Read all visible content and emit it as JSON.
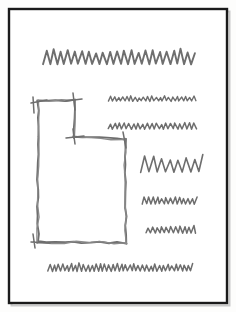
{
  "document": {
    "kind": "hand-drawn-wireframe-sketch",
    "medium": "pencil-on-paper",
    "title_alt": "Hand drawn page layout wireframe",
    "canvas": {
      "width": 236,
      "height": 312
    }
  },
  "colors": {
    "paper": "#fdfdfc",
    "page_fill": "#ffffff",
    "frame_stroke": "#1a1a1a",
    "pencil_stroke": "#6e6e6e",
    "pencil_stroke_light": "#8a8a8a",
    "shadow": "#c9c9c9"
  },
  "frame": {
    "label": "page-border",
    "x": 9,
    "y": 9,
    "width": 218,
    "height": 294,
    "stroke_width": 2.4
  },
  "elements": [
    {
      "id": "title-scribble",
      "name": "title-placeholder",
      "role": "heading",
      "shape": "zigzag",
      "x": 43,
      "y": 64,
      "width": 152,
      "amplitude": 13,
      "period": 7.0,
      "stroke_width": 1.9,
      "description": "Large heading scribble across top of page"
    },
    {
      "id": "body-line-1",
      "name": "body-text-line-1",
      "role": "paragraph-line",
      "shape": "zigzag",
      "x": 108,
      "y": 101,
      "width": 88,
      "amplitude": 4.5,
      "period": 4.2,
      "stroke_width": 1.4,
      "description": "Short text line right of image block"
    },
    {
      "id": "body-line-2",
      "name": "body-text-line-2",
      "role": "paragraph-line",
      "shape": "zigzag",
      "x": 108,
      "y": 129,
      "width": 88,
      "amplitude": 5.5,
      "period": 4.6,
      "stroke_width": 1.5,
      "description": "Second short text line right of image block"
    },
    {
      "id": "accent-scribble",
      "name": "accent-text-line",
      "role": "paragraph-line",
      "shape": "zigzag",
      "x": 141,
      "y": 172,
      "width": 62,
      "amplitude": 15,
      "period": 8.5,
      "stroke_width": 1.6,
      "description": "Tall wide-amplitude scribble, middle right"
    },
    {
      "id": "body-line-3",
      "name": "body-text-line-3",
      "role": "paragraph-line",
      "shape": "zigzag",
      "x": 142,
      "y": 204,
      "width": 55,
      "amplitude": 6,
      "period": 4.4,
      "stroke_width": 1.5,
      "description": "Short text line, lower right"
    },
    {
      "id": "body-line-4",
      "name": "body-text-line-4",
      "role": "paragraph-line",
      "shape": "zigzag",
      "x": 146,
      "y": 233,
      "width": 50,
      "amplitude": 6,
      "period": 4.6,
      "stroke_width": 1.5,
      "description": "Short text line, lower right"
    },
    {
      "id": "footer-scribble",
      "name": "footer-text-line",
      "role": "paragraph-line",
      "shape": "zigzag",
      "x": 48,
      "y": 271,
      "width": 145,
      "amplitude": 6.5,
      "period": 4.2,
      "stroke_width": 1.5,
      "description": "Full width scribble line at page bottom"
    }
  ],
  "image_block": {
    "id": "image-placeholder",
    "name": "stepped-image-block",
    "role": "image-placeholder",
    "shape": "stepped-rectangle",
    "description": "L-shaped / stepped rectangle: narrow box at top-left, wider box extending right and down",
    "bounds": {
      "x": 38,
      "y": 100,
      "width": 88,
      "height": 145
    },
    "vertices": [
      [
        38,
        101
      ],
      [
        74,
        100
      ],
      [
        74,
        137
      ],
      [
        125,
        139
      ],
      [
        126,
        243
      ],
      [
        38,
        242
      ]
    ]
  },
  "annotations": {
    "stroke_jitter": 0.9,
    "overshoot": 5
  }
}
